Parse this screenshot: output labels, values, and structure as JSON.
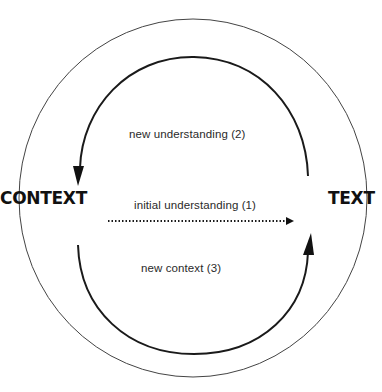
{
  "diagram": {
    "nodes": {
      "left": "CONTEXT",
      "right": "TEXT"
    },
    "edges": [
      {
        "id": "initial",
        "label": "initial understanding (1)",
        "from": "CONTEXT",
        "to": "TEXT",
        "style": "dotted",
        "arrow": "end"
      },
      {
        "id": "new-understanding",
        "label": "new understanding (2)",
        "from": "TEXT",
        "to": "CONTEXT",
        "style": "solid",
        "path": "upper-arc",
        "arrow": "end"
      },
      {
        "id": "new-context",
        "label": "new context (3)",
        "from": "CONTEXT",
        "to": "TEXT",
        "style": "solid",
        "path": "lower-arc",
        "arrow": "end"
      }
    ],
    "outer_circle": true,
    "colors": {
      "stroke": "#1a1a1a",
      "outer_stroke": "#444444",
      "background": "#ffffff",
      "text": "#2a2a2a"
    }
  }
}
